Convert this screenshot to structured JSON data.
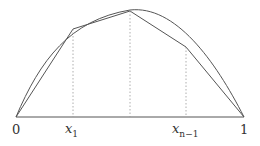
{
  "diagram": {
    "type": "curve-polygonal-approximation",
    "labels": {
      "zero": "0",
      "x1": "x",
      "x1_sub": "1",
      "xn1": "x",
      "xn1_sub": "n−1",
      "one": "1"
    },
    "colors": {
      "stroke": "#555555",
      "dotted": "#999999"
    }
  }
}
